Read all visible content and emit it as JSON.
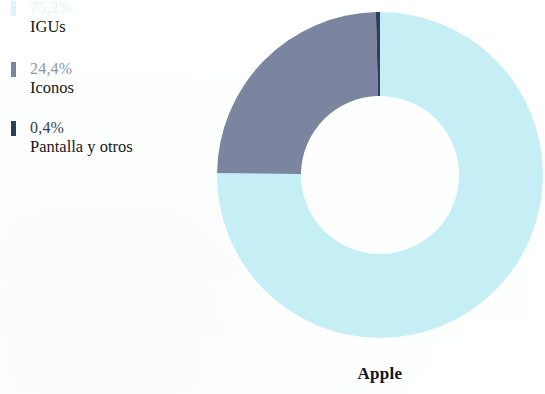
{
  "chart_data": {
    "type": "pie",
    "variant": "donut",
    "title": "Apple",
    "categories": [
      "IGUs",
      "Iconos",
      "Pantalla y otros"
    ],
    "values": [
      75.2,
      24.4,
      0.4
    ],
    "value_labels": [
      "75,2%",
      "24,4%",
      "0,4%"
    ],
    "colors": [
      "#c5eef5",
      "#7b85a0",
      "#2f3e5c"
    ],
    "unit": "%",
    "start_angle_deg": 0,
    "direction": "clockwise",
    "inner_radius_ratio": 0.485,
    "legend_position": "left",
    "grid": false,
    "xlabel": "",
    "ylabel": ""
  },
  "legend": {
    "items": [
      {
        "pct": "75,2%",
        "label": "IGUs",
        "color": "#c5eef5"
      },
      {
        "pct": "24,4%",
        "label": "Iconos",
        "color": "#7b85a0"
      },
      {
        "pct": "0,4%",
        "label": "Pantalla y otros",
        "color": "#2f3e5c"
      }
    ]
  },
  "caption": {
    "text": "Apple"
  }
}
